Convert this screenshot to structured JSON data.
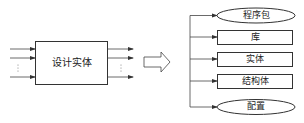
{
  "diagram": {
    "entity": {
      "label": "设计实体"
    },
    "transform_arrow": {
      "icon": "hollow-right-arrow"
    },
    "components": [
      {
        "label": "程序包",
        "shape": "ellipse"
      },
      {
        "label": "库",
        "shape": "rect"
      },
      {
        "label": "实体",
        "shape": "rect"
      },
      {
        "label": "结构体",
        "shape": "rect"
      },
      {
        "label": "配置",
        "shape": "ellipse"
      }
    ],
    "ellipsis": "⋮",
    "colors": {
      "stroke": "#333333",
      "text": "#222222",
      "background": "#ffffff"
    }
  }
}
